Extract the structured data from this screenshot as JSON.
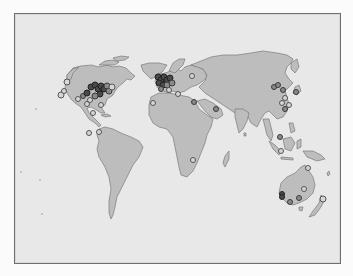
{
  "map": {
    "type": "world-location-map",
    "background_color": "#e8e8e8",
    "land_color": "#bdbdbd",
    "border_color": "#6e6e6e",
    "marker_fill": "#d6d6d6",
    "marker_stroke": "#555555",
    "markers": [
      {
        "region": "north-america-west",
        "x": 66,
        "y": 81,
        "r": 3,
        "style": "light"
      },
      {
        "region": "north-america-west",
        "x": 60,
        "y": 94,
        "r": 3,
        "style": "light"
      },
      {
        "region": "north-america-west",
        "x": 63,
        "y": 90,
        "r": 2.5,
        "style": "light"
      },
      {
        "region": "north-america-west",
        "x": 77,
        "y": 98,
        "r": 2.5,
        "style": "light"
      },
      {
        "region": "north-america-central",
        "x": 82,
        "y": 95,
        "r": 2.5,
        "style": "mid"
      },
      {
        "region": "north-america-central",
        "x": 86,
        "y": 92,
        "r": 3,
        "style": "dense"
      },
      {
        "region": "north-america-east",
        "x": 90,
        "y": 86,
        "r": 3,
        "style": "dense"
      },
      {
        "region": "north-america-east",
        "x": 94,
        "y": 84,
        "r": 3,
        "style": "dense"
      },
      {
        "region": "north-america-east",
        "x": 97,
        "y": 88,
        "r": 3,
        "style": "dense"
      },
      {
        "region": "north-america-east",
        "x": 100,
        "y": 85,
        "r": 3,
        "style": "dense"
      },
      {
        "region": "north-america-east",
        "x": 103,
        "y": 88,
        "r": 3,
        "style": "dense"
      },
      {
        "region": "north-america-east",
        "x": 106,
        "y": 85,
        "r": 3,
        "style": "mid"
      },
      {
        "region": "north-america-east",
        "x": 108,
        "y": 90,
        "r": 3,
        "style": "mid"
      },
      {
        "region": "north-america-east",
        "x": 111,
        "y": 86,
        "r": 3,
        "style": "light"
      },
      {
        "region": "north-america-east",
        "x": 99,
        "y": 93,
        "r": 3,
        "style": "dense"
      },
      {
        "region": "north-america-east",
        "x": 94,
        "y": 95,
        "r": 3,
        "style": "mid"
      },
      {
        "region": "north-america-east",
        "x": 89,
        "y": 99,
        "r": 2.5,
        "style": "light"
      },
      {
        "region": "north-america-south",
        "x": 86,
        "y": 103,
        "r": 2.5,
        "style": "light"
      },
      {
        "region": "north-america-south",
        "x": 100,
        "y": 104,
        "r": 2.5,
        "style": "light"
      },
      {
        "region": "caribbean",
        "x": 92,
        "y": 112,
        "r": 2.5,
        "style": "light"
      },
      {
        "region": "central-america",
        "x": 98,
        "y": 131,
        "r": 2.5,
        "style": "light"
      },
      {
        "region": "south-america",
        "x": 88,
        "y": 132,
        "r": 2.5,
        "style": "light"
      },
      {
        "region": "europe-west",
        "x": 157,
        "y": 76,
        "r": 3,
        "style": "dense"
      },
      {
        "region": "europe-west",
        "x": 160,
        "y": 79,
        "r": 3,
        "style": "dense"
      },
      {
        "region": "europe-west",
        "x": 163,
        "y": 76,
        "r": 3,
        "style": "dense"
      },
      {
        "region": "europe-west",
        "x": 166,
        "y": 79,
        "r": 3,
        "style": "dense"
      },
      {
        "region": "europe-west",
        "x": 169,
        "y": 77,
        "r": 3,
        "style": "dense"
      },
      {
        "region": "europe-west",
        "x": 158,
        "y": 82,
        "r": 3,
        "style": "dense"
      },
      {
        "region": "europe-west",
        "x": 162,
        "y": 84,
        "r": 3,
        "style": "dense"
      },
      {
        "region": "europe-west",
        "x": 166,
        "y": 84,
        "r": 3,
        "style": "mid"
      },
      {
        "region": "europe-central",
        "x": 171,
        "y": 82,
        "r": 3,
        "style": "mid"
      },
      {
        "region": "europe-south",
        "x": 160,
        "y": 88,
        "r": 2.5,
        "style": "mid"
      },
      {
        "region": "europe-south",
        "x": 168,
        "y": 89,
        "r": 2.5,
        "style": "light"
      },
      {
        "region": "europe-east",
        "x": 191,
        "y": 75,
        "r": 2.5,
        "style": "light"
      },
      {
        "region": "mediterranean",
        "x": 177,
        "y": 93,
        "r": 2.5,
        "style": "light"
      },
      {
        "region": "middle-east",
        "x": 193,
        "y": 101,
        "r": 2.5,
        "style": "mid"
      },
      {
        "region": "africa-west",
        "x": 152,
        "y": 102,
        "r": 2.5,
        "style": "light"
      },
      {
        "region": "arabia",
        "x": 215,
        "y": 108,
        "r": 2.5,
        "style": "mid"
      },
      {
        "region": "africa-south",
        "x": 192,
        "y": 159,
        "r": 2.5,
        "style": "light"
      },
      {
        "region": "east-asia",
        "x": 273,
        "y": 86,
        "r": 2.5,
        "style": "mid"
      },
      {
        "region": "east-asia",
        "x": 277,
        "y": 84,
        "r": 2.5,
        "style": "mid"
      },
      {
        "region": "east-asia",
        "x": 282,
        "y": 89,
        "r": 2.5,
        "style": "mid"
      },
      {
        "region": "japan",
        "x": 295,
        "y": 91,
        "r": 2.5,
        "style": "mid"
      },
      {
        "region": "east-asia",
        "x": 284,
        "y": 97,
        "r": 2.5,
        "style": "light"
      },
      {
        "region": "east-asia",
        "x": 281,
        "y": 102,
        "r": 2.5,
        "style": "light"
      },
      {
        "region": "east-asia",
        "x": 288,
        "y": 104,
        "r": 2.5,
        "style": "light"
      },
      {
        "region": "east-asia",
        "x": 284,
        "y": 108,
        "r": 2.5,
        "style": "mid"
      },
      {
        "region": "southeast-asia",
        "x": 280,
        "y": 150,
        "r": 2.5,
        "style": "light"
      },
      {
        "region": "southeast-asia",
        "x": 279,
        "y": 136,
        "r": 2.5,
        "style": "mid"
      },
      {
        "region": "new-guinea",
        "x": 307,
        "y": 167,
        "r": 2.5,
        "style": "light"
      },
      {
        "region": "australia-west",
        "x": 281,
        "y": 193,
        "r": 2.5,
        "style": "dense"
      },
      {
        "region": "australia-west",
        "x": 281,
        "y": 196,
        "r": 2.5,
        "style": "dense"
      },
      {
        "region": "australia-east",
        "x": 303,
        "y": 188,
        "r": 2.5,
        "style": "light"
      },
      {
        "region": "australia-south",
        "x": 298,
        "y": 197,
        "r": 2.5,
        "style": "mid"
      },
      {
        "region": "australia-south",
        "x": 289,
        "y": 201,
        "r": 2.5,
        "style": "mid"
      },
      {
        "region": "new-zealand",
        "x": 322,
        "y": 198,
        "r": 3,
        "style": "light"
      }
    ],
    "specks": [
      {
        "x": 35,
        "y": 108
      },
      {
        "x": 20,
        "y": 171
      },
      {
        "x": 39,
        "y": 179
      },
      {
        "x": 41,
        "y": 213
      }
    ]
  }
}
